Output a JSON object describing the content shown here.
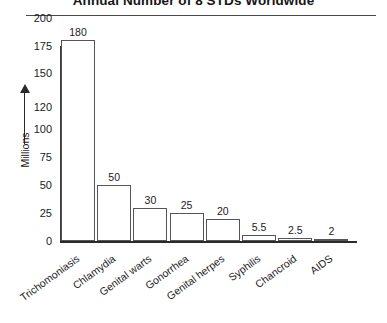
{
  "chart_data": {
    "type": "bar",
    "title": "Annual Number of 8 STDs Worldwide",
    "xlabel": "",
    "ylabel": "Millions",
    "ylim": [
      0,
      200
    ],
    "grid": false,
    "legend": false,
    "y_ticks": [
      "200",
      "175",
      "150",
      "120",
      "100",
      "75",
      "50",
      "25",
      "0"
    ],
    "y_tick_values": [
      200,
      175,
      150,
      120,
      100,
      75,
      50,
      25,
      0
    ],
    "categories": [
      "Trichomoniasis",
      "Chlamydia",
      "Genital warts",
      "Gonorrhea",
      "Genital herpes",
      "Syphilis",
      "Chancroid",
      "AIDS"
    ],
    "values": [
      180,
      50,
      30,
      25,
      20,
      5.5,
      2.5,
      2
    ],
    "value_labels": [
      "180",
      "50",
      "30",
      "25",
      "20",
      "5.5",
      "2.5",
      "2"
    ],
    "bar_face_color": "#ffffff",
    "bar_edge_color": "#555555",
    "axis_color": "#2b2b2b",
    "text_color": "#1b1b1b"
  }
}
